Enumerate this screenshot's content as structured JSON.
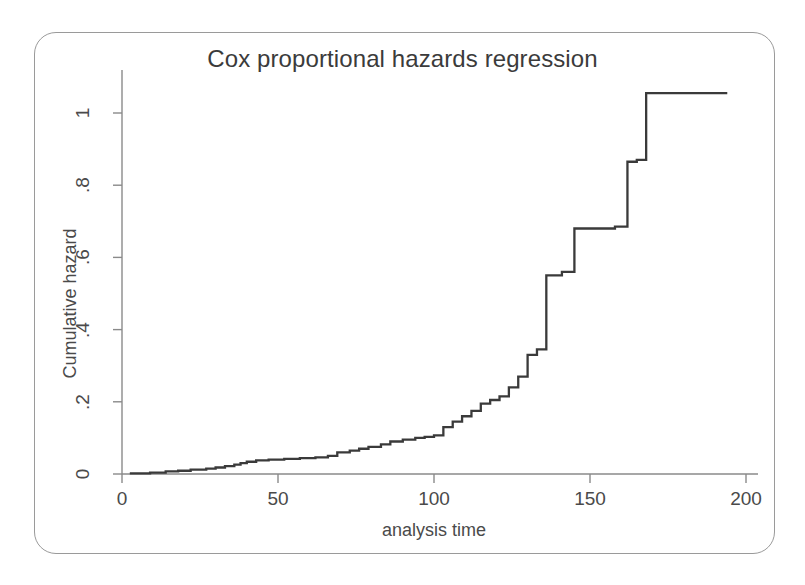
{
  "chart_data": {
    "type": "line",
    "title": "Cox proportional hazards regression",
    "xlabel": "analysis time",
    "ylabel": "Cumulative hazard",
    "xlim": [
      0,
      200
    ],
    "ylim": [
      0,
      1.12
    ],
    "grid": false,
    "legend": null,
    "line_color": "#3a3a3a",
    "frame_color": "#9a9a9a",
    "axis_color": "#8a8a8a",
    "background": "#ffffff",
    "step_style": "post",
    "x_ticks": [
      {
        "value": 0,
        "label": "0"
      },
      {
        "value": 50,
        "label": "50"
      },
      {
        "value": 100,
        "label": "100"
      },
      {
        "value": 150,
        "label": "150"
      },
      {
        "value": 200,
        "label": "200"
      }
    ],
    "y_ticks": [
      {
        "value": 0,
        "label": "0"
      },
      {
        "value": 0.2,
        "label": ".2"
      },
      {
        "value": 0.4,
        "label": ".4"
      },
      {
        "value": 0.6,
        "label": ".6"
      },
      {
        "value": 0.8,
        "label": ".8"
      },
      {
        "value": 1.0,
        "label": "1"
      }
    ],
    "x": [
      2.5,
      9,
      14,
      18,
      22,
      27,
      30,
      33,
      36,
      38,
      40,
      43,
      47,
      52,
      57,
      62,
      66,
      69,
      73,
      76,
      79,
      83,
      86,
      90,
      94,
      97,
      100,
      103,
      106,
      109,
      112,
      115,
      118,
      121,
      124,
      127,
      130,
      133,
      136,
      141,
      145,
      152,
      158,
      162,
      165,
      168,
      175,
      185,
      194
    ],
    "y": [
      0.002,
      0.004,
      0.007,
      0.009,
      0.012,
      0.015,
      0.018,
      0.022,
      0.026,
      0.03,
      0.034,
      0.038,
      0.04,
      0.042,
      0.044,
      0.046,
      0.05,
      0.06,
      0.065,
      0.07,
      0.075,
      0.082,
      0.09,
      0.095,
      0.1,
      0.103,
      0.107,
      0.13,
      0.145,
      0.16,
      0.175,
      0.195,
      0.205,
      0.215,
      0.24,
      0.27,
      0.33,
      0.345,
      0.55,
      0.56,
      0.68,
      0.68,
      0.685,
      0.865,
      0.87,
      1.055,
      1.055,
      1.055,
      1.055
    ]
  },
  "geometry": {
    "plot_x0_px": 122,
    "plot_x1_px": 746,
    "plot_y0_px": 474,
    "plot_y1_px": 113
  }
}
